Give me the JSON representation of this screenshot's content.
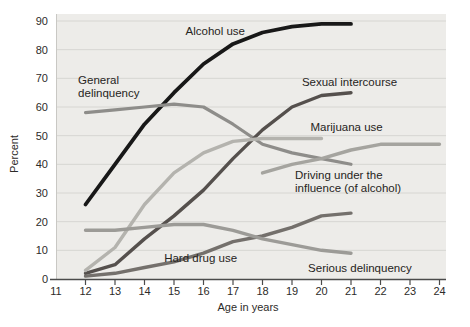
{
  "chart_data": {
    "type": "line",
    "title": "",
    "xlabel": "Age in years",
    "ylabel": "Percent",
    "xlim": [
      11,
      24
    ],
    "ylim": [
      0,
      90
    ],
    "grid": true,
    "legend_position": "inline-labels",
    "x_ticks": [
      11,
      12,
      13,
      14,
      15,
      16,
      17,
      18,
      19,
      20,
      21,
      22,
      23,
      24
    ],
    "y_ticks": [
      0,
      10,
      20,
      30,
      40,
      50,
      60,
      70,
      80,
      90
    ],
    "series": [
      {
        "name": "Alcohol use",
        "color": "#181818",
        "width": 3.8,
        "x": [
          12,
          13,
          14,
          15,
          16,
          17,
          18,
          19,
          20,
          21
        ],
        "values": [
          26,
          40,
          54,
          65,
          75,
          82,
          86,
          88,
          89,
          89
        ]
      },
      {
        "name": "General delinquency",
        "color": "#8e8d8a",
        "width": 3.2,
        "x": [
          12,
          13,
          14,
          15,
          16,
          17,
          18,
          19,
          20,
          21
        ],
        "values": [
          58,
          59,
          60,
          61,
          60,
          54,
          47,
          44,
          42,
          40
        ]
      },
      {
        "name": "Sexual intercourse",
        "color": "#55504d",
        "width": 3.4,
        "x": [
          12,
          13,
          14,
          15,
          16,
          17,
          18,
          19,
          20,
          21
        ],
        "values": [
          2,
          5,
          14,
          22,
          31,
          42,
          52,
          60,
          64,
          65
        ]
      },
      {
        "name": "Marijuana use",
        "color": "#b4b3ae",
        "width": 3.4,
        "x": [
          12,
          13,
          14,
          15,
          16,
          17,
          18,
          19,
          20
        ],
        "values": [
          3,
          11,
          26,
          37,
          44,
          48,
          49,
          49,
          49
        ]
      },
      {
        "name": "Driving under the influence (of alcohol)",
        "color": "#a5a49f",
        "width": 3.4,
        "x": [
          18,
          19,
          20,
          21,
          22,
          23,
          24
        ],
        "values": [
          37,
          40,
          42,
          45,
          47,
          47,
          47
        ]
      },
      {
        "name": "Hard drug use",
        "color": "#74706c",
        "width": 3.4,
        "x": [
          12,
          13,
          14,
          15,
          16,
          17,
          18,
          19,
          20,
          21
        ],
        "values": [
          1,
          2,
          4,
          6,
          9,
          13,
          15,
          18,
          22,
          23
        ]
      },
      {
        "name": "Serious delinquency",
        "color": "#9c9b97",
        "width": 3.4,
        "x": [
          12,
          13,
          14,
          15,
          16,
          17,
          18,
          19,
          20,
          21
        ],
        "values": [
          17,
          17,
          18,
          19,
          19,
          17,
          14,
          12,
          10,
          9
        ]
      }
    ],
    "labels": [
      {
        "text": "Alcohol use",
        "lines": [
          "Alcohol use"
        ],
        "age": 16.4,
        "pct": 85,
        "anchor": "middle"
      },
      {
        "text": "General delinquency",
        "lines": [
          "General",
          "delinquency"
        ],
        "age": 11.75,
        "pct": 68,
        "anchor": "start"
      },
      {
        "text": "Sexual intercourse",
        "lines": [
          "Sexual intercourse"
        ],
        "age": 20.95,
        "pct": 67.5,
        "anchor": "middle"
      },
      {
        "text": "Marijuana use",
        "lines": [
          "Marijuana use"
        ],
        "age": 20.85,
        "pct": 51.5,
        "anchor": "middle"
      },
      {
        "text": "Driving under the influence (of alcohol)",
        "lines": [
          "Driving under the",
          "influence (of alcohol)"
        ],
        "age": 19.1,
        "pct": 35,
        "anchor": "start"
      },
      {
        "text": "Hard drug use",
        "lines": [
          "Hard drug use"
        ],
        "age": 15.9,
        "pct": 5.8,
        "anchor": "middle"
      },
      {
        "text": "Serious delinquency",
        "lines": [
          "Serious delinquency"
        ],
        "age": 21.3,
        "pct": 2.3,
        "anchor": "middle"
      }
    ],
    "palette": {
      "plot_background": "#edece9",
      "gridline": "#d7d6d2",
      "axis_line": "#4b4b4b",
      "tick_text": "#2d2b29",
      "label_text": "#262422"
    }
  }
}
